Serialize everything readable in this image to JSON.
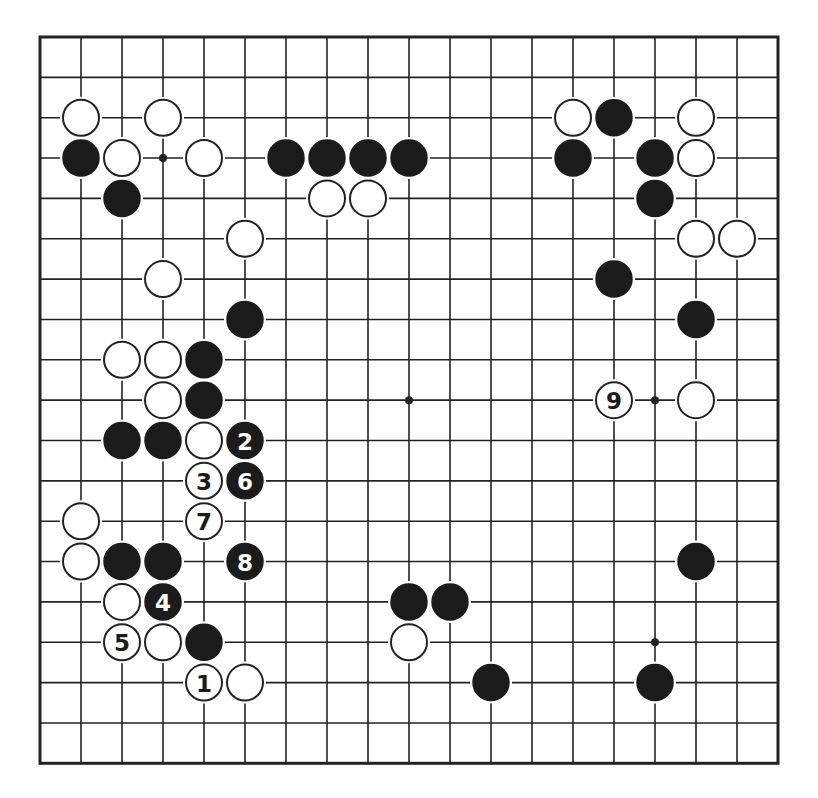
{
  "board": {
    "size": 19,
    "origin": {
      "x": 40,
      "y": 37
    },
    "spacing": {
      "x": 41,
      "y": 40.35
    },
    "stone_radius": 18,
    "colors": {
      "line": "#222222",
      "black": "#1b1b1b",
      "white": "#ffffff",
      "background": "#ffffff"
    },
    "star_points": [
      [
        3,
        3
      ],
      [
        9,
        9
      ],
      [
        15,
        9
      ],
      [
        15,
        15
      ]
    ]
  },
  "stones": [
    {
      "col": 1,
      "row": 2,
      "color": "white"
    },
    {
      "col": 3,
      "row": 2,
      "color": "white"
    },
    {
      "col": 13,
      "row": 2,
      "color": "white"
    },
    {
      "col": 14,
      "row": 2,
      "color": "black"
    },
    {
      "col": 16,
      "row": 2,
      "color": "white"
    },
    {
      "col": 1,
      "row": 3,
      "color": "black"
    },
    {
      "col": 2,
      "row": 3,
      "color": "white"
    },
    {
      "col": 4,
      "row": 3,
      "color": "white"
    },
    {
      "col": 6,
      "row": 3,
      "color": "black"
    },
    {
      "col": 7,
      "row": 3,
      "color": "black"
    },
    {
      "col": 8,
      "row": 3,
      "color": "black"
    },
    {
      "col": 9,
      "row": 3,
      "color": "black"
    },
    {
      "col": 13,
      "row": 3,
      "color": "black"
    },
    {
      "col": 15,
      "row": 3,
      "color": "black"
    },
    {
      "col": 16,
      "row": 3,
      "color": "white"
    },
    {
      "col": 2,
      "row": 4,
      "color": "black"
    },
    {
      "col": 7,
      "row": 4,
      "color": "white"
    },
    {
      "col": 8,
      "row": 4,
      "color": "white"
    },
    {
      "col": 15,
      "row": 4,
      "color": "black"
    },
    {
      "col": 5,
      "row": 5,
      "color": "white"
    },
    {
      "col": 16,
      "row": 5,
      "color": "white"
    },
    {
      "col": 17,
      "row": 5,
      "color": "white"
    },
    {
      "col": 3,
      "row": 6,
      "color": "white"
    },
    {
      "col": 14,
      "row": 6,
      "color": "black"
    },
    {
      "col": 5,
      "row": 7,
      "color": "black"
    },
    {
      "col": 16,
      "row": 7,
      "color": "black"
    },
    {
      "col": 2,
      "row": 8,
      "color": "white"
    },
    {
      "col": 3,
      "row": 8,
      "color": "white"
    },
    {
      "col": 4,
      "row": 8,
      "color": "black"
    },
    {
      "col": 3,
      "row": 9,
      "color": "white"
    },
    {
      "col": 4,
      "row": 9,
      "color": "black"
    },
    {
      "col": 14,
      "row": 9,
      "color": "white",
      "label": "9"
    },
    {
      "col": 16,
      "row": 9,
      "color": "white"
    },
    {
      "col": 2,
      "row": 10,
      "color": "black"
    },
    {
      "col": 3,
      "row": 10,
      "color": "black"
    },
    {
      "col": 4,
      "row": 10,
      "color": "white"
    },
    {
      "col": 5,
      "row": 10,
      "color": "black",
      "label": "2"
    },
    {
      "col": 4,
      "row": 11,
      "color": "white",
      "label": "3"
    },
    {
      "col": 5,
      "row": 11,
      "color": "black",
      "label": "6"
    },
    {
      "col": 1,
      "row": 12,
      "color": "white"
    },
    {
      "col": 4,
      "row": 12,
      "color": "white",
      "label": "7"
    },
    {
      "col": 1,
      "row": 13,
      "color": "white"
    },
    {
      "col": 2,
      "row": 13,
      "color": "black"
    },
    {
      "col": 3,
      "row": 13,
      "color": "black"
    },
    {
      "col": 5,
      "row": 13,
      "color": "black",
      "label": "8"
    },
    {
      "col": 16,
      "row": 13,
      "color": "black"
    },
    {
      "col": 2,
      "row": 14,
      "color": "white"
    },
    {
      "col": 3,
      "row": 14,
      "color": "black",
      "label": "4"
    },
    {
      "col": 9,
      "row": 14,
      "color": "black"
    },
    {
      "col": 10,
      "row": 14,
      "color": "black"
    },
    {
      "col": 2,
      "row": 15,
      "color": "white",
      "label": "5"
    },
    {
      "col": 3,
      "row": 15,
      "color": "white"
    },
    {
      "col": 4,
      "row": 15,
      "color": "black"
    },
    {
      "col": 9,
      "row": 15,
      "color": "white"
    },
    {
      "col": 4,
      "row": 16,
      "color": "white",
      "label": "1"
    },
    {
      "col": 5,
      "row": 16,
      "color": "white"
    },
    {
      "col": 11,
      "row": 16,
      "color": "black"
    },
    {
      "col": 15,
      "row": 16,
      "color": "black"
    }
  ]
}
